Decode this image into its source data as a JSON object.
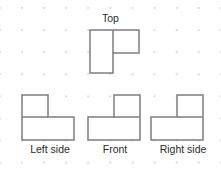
{
  "figure": {
    "kind": "orthographic-projection-views",
    "background": {
      "grid_dot_color": "#d9d9de",
      "grid_spacing_px": 22,
      "grid_origin_px": [
        21,
        7
      ],
      "grid_columns": 9,
      "grid_rows": 8,
      "page_color": "#ffffff"
    },
    "stroke_color": "#7d7d82",
    "stroke_width_px": 1.5,
    "fill_color": "#ffffff",
    "unit_px": 23,
    "views": [
      {
        "id": "top",
        "label": "Top",
        "label_position": "above",
        "description": "Tall 1x2 rectangle on the left with a 1x1 square attached at its upper right",
        "cells": [
          [
            0,
            0
          ],
          [
            0,
            1
          ],
          [
            1,
            0
          ]
        ],
        "outline_points": "90,30 139,30 139,53 113,53 113,73 90,73",
        "inner_lines": [
          {
            "x1": 113,
            "y1": 30,
            "x2": 113,
            "y2": 53
          }
        ]
      },
      {
        "id": "left-side",
        "label": "Left side",
        "label_position": "below",
        "description": "A 1x1 square at the upper left sitting on a 2x1 rectangle",
        "cells": [
          [
            0,
            0
          ],
          [
            0,
            1
          ],
          [
            1,
            1
          ]
        ],
        "outline_points": "22,95 48,95 48,117 74,117 74,140 22,140",
        "inner_lines": [
          {
            "x1": 22,
            "y1": 117,
            "x2": 48,
            "y2": 117
          }
        ]
      },
      {
        "id": "front",
        "label": "Front",
        "label_position": "below",
        "description": "Tall 1x2 rectangle on the right with a 1x1 square at its lower left",
        "cells": [
          [
            1,
            0
          ],
          [
            0,
            1
          ],
          [
            1,
            1
          ]
        ],
        "outline_points": "114,95 140,95 140,140 88,140 88,117 114,117",
        "inner_lines": [
          {
            "x1": 114,
            "y1": 117,
            "x2": 140,
            "y2": 117
          }
        ]
      },
      {
        "id": "right-side",
        "label": "Right side",
        "label_position": "below",
        "description": "Tall 1x2 rectangle on the right with a 1x1 square at its lower left",
        "cells": [
          [
            1,
            0
          ],
          [
            0,
            1
          ],
          [
            1,
            1
          ]
        ],
        "outline_points": "177,95 203,95 203,140 151,140 151,117 177,117",
        "inner_lines": [
          {
            "x1": 177,
            "y1": 117,
            "x2": 203,
            "y2": 117
          }
        ]
      }
    ]
  },
  "labels": {
    "top": "Top",
    "left_side": "Left side",
    "front": "Front",
    "right_side": "Right side"
  }
}
